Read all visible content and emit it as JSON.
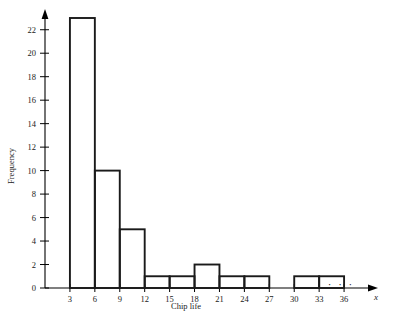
{
  "chart_data": {
    "type": "bar",
    "title": "",
    "subtitle": "",
    "xlabel": "Chip life",
    "ylabel": "Frequency",
    "x_axis_variable": "x",
    "grid": false,
    "legend": "none",
    "xlim": [
      0,
      39
    ],
    "ylim": [
      0,
      23
    ],
    "x_tick_labels": [
      "3",
      "6",
      "9",
      "12",
      "15",
      "18",
      "21",
      "24",
      "27",
      "30",
      "33",
      "36"
    ],
    "x_tick_values": [
      3,
      6,
      9,
      12,
      15,
      18,
      21,
      24,
      27,
      30,
      33,
      36
    ],
    "y_tick_labels": [
      "0",
      "2",
      "4",
      "6",
      "8",
      "10",
      "12",
      "14",
      "16",
      "18",
      "20",
      "22"
    ],
    "y_tick_values": [
      0,
      2,
      4,
      6,
      8,
      10,
      12,
      14,
      16,
      18,
      20,
      22
    ],
    "bin_width": 3,
    "bins": [
      {
        "start": 3,
        "end": 6,
        "label": "3-6",
        "frequency": 23
      },
      {
        "start": 6,
        "end": 9,
        "label": "6-9",
        "frequency": 10
      },
      {
        "start": 9,
        "end": 12,
        "label": "9-12",
        "frequency": 5
      },
      {
        "start": 12,
        "end": 15,
        "label": "12-15",
        "frequency": 1
      },
      {
        "start": 15,
        "end": 18,
        "label": "15-18",
        "frequency": 1
      },
      {
        "start": 18,
        "end": 21,
        "label": "18-21",
        "frequency": 2
      },
      {
        "start": 21,
        "end": 24,
        "label": "21-24",
        "frequency": 1
      },
      {
        "start": 24,
        "end": 27,
        "label": "24-27",
        "frequency": 1
      },
      {
        "start": 27,
        "end": 30,
        "label": "27-30",
        "frequency": 0
      },
      {
        "start": 30,
        "end": 33,
        "label": "30-33",
        "frequency": 1
      },
      {
        "start": 33,
        "end": 36,
        "label": "33-36",
        "frequency": 1
      }
    ],
    "categories": [
      "3-6",
      "6-9",
      "9-12",
      "12-15",
      "15-18",
      "18-21",
      "21-24",
      "24-27",
      "27-30",
      "30-33",
      "33-36"
    ],
    "values": [
      23,
      10,
      5,
      1,
      1,
      2,
      1,
      1,
      0,
      1,
      1
    ],
    "annotations": {
      "x_axis_continuation": "· · ·"
    },
    "colors": {
      "bar_stroke": "#1a1a1a",
      "bar_fill": "#ffffff",
      "axis": "#000000",
      "background": "#ffffff"
    }
  }
}
